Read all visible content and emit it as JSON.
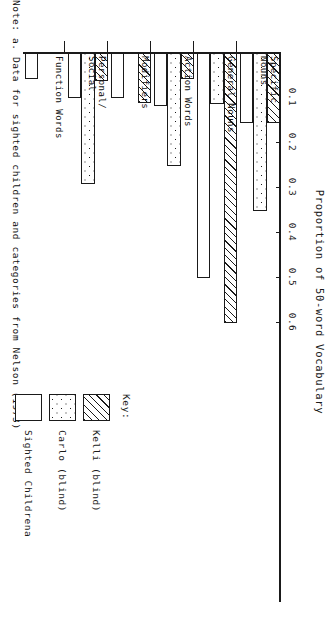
{
  "note": "Note:  a.  Data for sighted children and categories from Nelson (1973)",
  "legend": {
    "title": "Key:",
    "entries": [
      {
        "label": "Kelli (blind)",
        "pattern": "hatch"
      },
      {
        "label": "Carlo (blind)",
        "pattern": "dots"
      },
      {
        "label": "Sighted Childrena",
        "pattern": "plain"
      }
    ]
  },
  "chart_data": {
    "type": "bar",
    "orientation": "horizontal",
    "title": "Proportion of 50-word Vocabulary",
    "xlabel": "Proportion of 50-word Vocabulary",
    "ylabel": "",
    "xlim": [
      0,
      0.62
    ],
    "grid": false,
    "legend_position": "right",
    "tick_labels": [
      "0.1",
      "0.2",
      "0.3",
      "0.4",
      "0.5",
      "0.6"
    ],
    "tick_values": [
      0.1,
      0.2,
      0.3,
      0.4,
      0.5,
      0.6
    ],
    "categories": [
      "Specific\nNouns",
      "General Nouns",
      "Action Words",
      "Modifiers",
      "Personal/\nSocial",
      "Function Words"
    ],
    "series": [
      {
        "name": "Kelli (blind)",
        "pattern": "hatch",
        "values": [
          0.155,
          0.6,
          0.058,
          0.11,
          0.063,
          0.0
        ]
      },
      {
        "name": "Carlo (blind)",
        "pattern": "dots",
        "values": [
          0.35,
          0.113,
          0.25,
          0.0,
          0.29,
          0.0
        ]
      },
      {
        "name": "Sighted Childrena",
        "pattern": "plain",
        "values": [
          0.155,
          0.5,
          0.118,
          0.1,
          0.1,
          0.058
        ]
      }
    ]
  }
}
